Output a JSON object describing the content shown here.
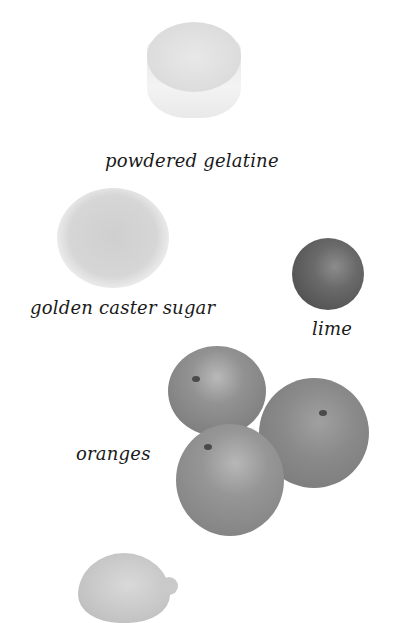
{
  "ingredients": [
    {
      "label": "powdered gelatine",
      "image": "ramekin-of-gelatine"
    },
    {
      "label": "golden caster sugar",
      "image": "glass-bowl-of-sugar"
    },
    {
      "label": "lime",
      "image": "lime"
    },
    {
      "label": "oranges",
      "image": "three-oranges"
    },
    {
      "label": "",
      "image": "lemon-partial"
    }
  ]
}
